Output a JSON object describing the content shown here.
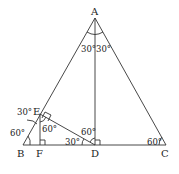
{
  "diagram": {
    "points": {
      "A": {
        "label": "A",
        "x": 95,
        "y": 18
      },
      "B": {
        "label": "B",
        "x": 23,
        "y": 145
      },
      "C": {
        "label": "C",
        "x": 166,
        "y": 145
      },
      "D": {
        "label": "D",
        "x": 95,
        "y": 145
      },
      "E": {
        "label": "E",
        "x": 40,
        "y": 114
      },
      "F": {
        "label": "F",
        "x": 40,
        "y": 145
      }
    },
    "segments": [
      "AB",
      "AC",
      "BC",
      "AD",
      "DE",
      "EF"
    ],
    "angle_labels": {
      "A_left": "30°",
      "A_right": "30°",
      "E_top": "30°",
      "B": "60°",
      "E_F": "60°",
      "D_top": "60°",
      "D_left": "30°",
      "C": "60°"
    },
    "right_angles": [
      "E",
      "F",
      "D"
    ]
  }
}
